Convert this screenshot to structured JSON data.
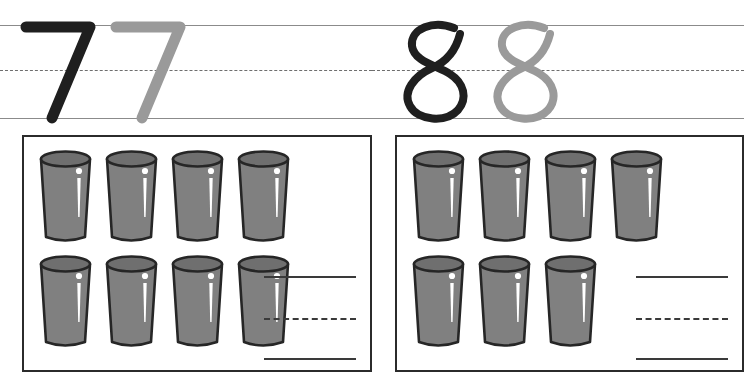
{
  "worksheet": {
    "kind": "handwriting-and-counting-worksheet",
    "colors": {
      "stroke_dark": "#1f1f1f",
      "stroke_gray": "#9a9a9a",
      "rule_line": "#8b8b8b",
      "box_border": "#2b2b2b",
      "glass_fill": "#808080",
      "glass_rim": "#6f6f6f",
      "glass_outline": "#262626",
      "highlight": "#ffffff",
      "answer_line": "#3a3a3a"
    }
  },
  "sections": [
    {
      "id": "left",
      "trace": {
        "digit": "7",
        "glyph_name": "digit-seven",
        "samples": [
          {
            "label": "7",
            "style": "dark",
            "color": "#1f1f1f"
          },
          {
            "label": "7",
            "style": "gray",
            "color": "#9a9a9a"
          }
        ],
        "rules": [
          {
            "name": "top-line",
            "style": "solid"
          },
          {
            "name": "mid-line",
            "style": "dashed"
          },
          {
            "name": "baseline",
            "style": "solid"
          }
        ]
      },
      "count_box": {
        "item_name": "drinking-glass",
        "total": 8,
        "rows": [
          {
            "name": "top-row",
            "count": 4
          },
          {
            "name": "bottom-row",
            "count": 4
          }
        ],
        "answer_area": {
          "name": "answer-writing-lines",
          "value": "",
          "placeholder": "",
          "lines": [
            {
              "name": "answer-top-line",
              "style": "solid"
            },
            {
              "name": "answer-mid-line",
              "style": "dashed"
            },
            {
              "name": "answer-baseline",
              "style": "solid"
            }
          ]
        }
      }
    },
    {
      "id": "right",
      "trace": {
        "digit": "8",
        "glyph_name": "digit-eight",
        "samples": [
          {
            "label": "8",
            "style": "dark",
            "color": "#1f1f1f"
          },
          {
            "label": "8",
            "style": "gray",
            "color": "#9a9a9a"
          }
        ],
        "rules": [
          {
            "name": "top-line",
            "style": "solid"
          },
          {
            "name": "mid-line",
            "style": "dashed"
          },
          {
            "name": "baseline",
            "style": "solid"
          }
        ]
      },
      "count_box": {
        "item_name": "drinking-glass",
        "total": 7,
        "rows": [
          {
            "name": "top-row",
            "count": 4
          },
          {
            "name": "bottom-row",
            "count": 3
          }
        ],
        "answer_area": {
          "name": "answer-writing-lines",
          "value": "",
          "placeholder": "",
          "lines": [
            {
              "name": "answer-top-line",
              "style": "solid"
            },
            {
              "name": "answer-mid-line",
              "style": "dashed"
            },
            {
              "name": "answer-baseline",
              "style": "solid"
            }
          ]
        }
      }
    }
  ]
}
